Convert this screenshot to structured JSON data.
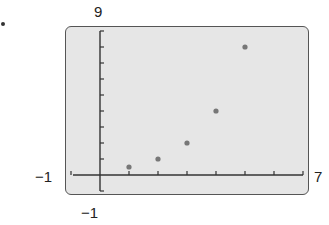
{
  "labels": {
    "ymax": "9",
    "ymin": "−1",
    "xmin": "−1",
    "xmax": "7"
  },
  "chart_data": {
    "type": "scatter",
    "title": "",
    "xlabel": "",
    "ylabel": "",
    "xlim": [
      -1,
      7
    ],
    "ylim": [
      -1,
      9
    ],
    "x_tick_step": 1,
    "y_tick_step": 1,
    "grid": false,
    "legend": null,
    "x": [
      1,
      2,
      3,
      4,
      5
    ],
    "y": [
      0.5,
      1,
      2,
      4,
      8
    ],
    "point_color": "#777777",
    "screen_background": "#e6e6e6"
  }
}
